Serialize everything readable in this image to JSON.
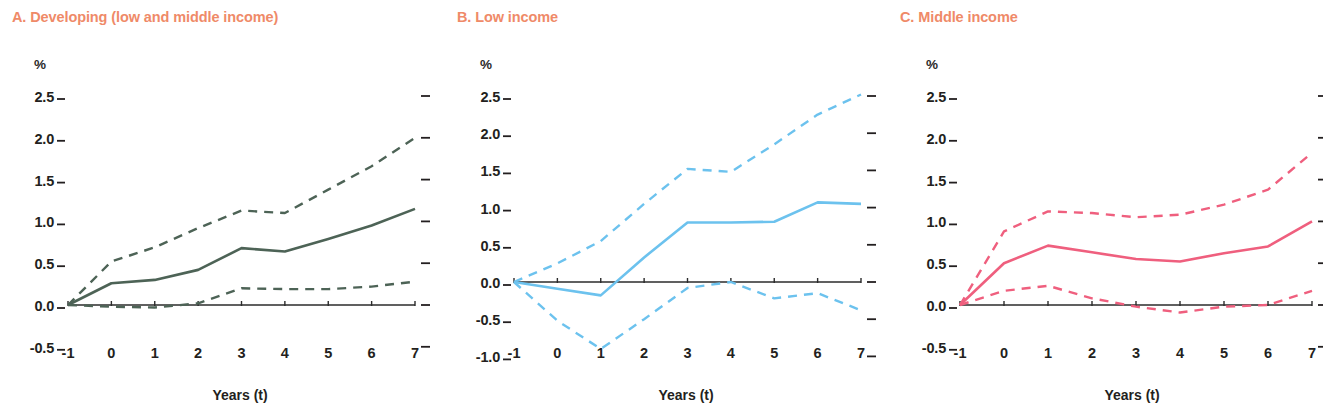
{
  "figure": {
    "title_color": "#ef8a68",
    "axis_text_color": "#231f20",
    "background": "#ffffff",
    "unit_symbol": "%",
    "x_axis_title": "Years (t)"
  },
  "panels": [
    {
      "id": "A",
      "title": "A. Developing (low and middle income)",
      "color": "#4d6356",
      "y_ticks": [
        "2.5",
        "2.0",
        "1.5",
        "1.0",
        "0.5",
        "0.0",
        "-0.5"
      ],
      "x_ticks": [
        "-1",
        "0",
        "1",
        "2",
        "3",
        "4",
        "5",
        "6",
        "7"
      ]
    },
    {
      "id": "B",
      "title": "B. Low income",
      "color": "#6cc2ee",
      "y_ticks": [
        "2.5",
        "2.0",
        "1.5",
        "1.0",
        "0.5",
        "0.0",
        "-0.5",
        "-1.0"
      ],
      "x_ticks": [
        "-1",
        "0",
        "1",
        "2",
        "3",
        "4",
        "5",
        "6",
        "7"
      ]
    },
    {
      "id": "C",
      "title": "C. Middle income",
      "color": "#ef5f7e",
      "y_ticks": [
        "2.5",
        "2.0",
        "1.5",
        "1.0",
        "0.5",
        "0.0",
        "-0.5"
      ],
      "x_ticks": [
        "-1",
        "0",
        "1",
        "2",
        "3",
        "4",
        "5",
        "6",
        "7"
      ]
    }
  ],
  "chart_data": [
    {
      "type": "line",
      "panel": "A",
      "title": "A. Developing (low and middle income)",
      "xlabel": "Years (t)",
      "ylabel": "%",
      "x": [
        -1,
        0,
        1,
        2,
        3,
        4,
        5,
        6,
        7
      ],
      "xlim": [
        -1,
        7
      ],
      "ylim": [
        -0.5,
        2.5
      ],
      "yticks": [
        -0.5,
        0.0,
        0.5,
        1.0,
        1.5,
        2.0,
        2.5
      ],
      "grid": false,
      "legend": "none",
      "color": "#4d6356",
      "series": [
        {
          "name": "Point estimate",
          "style": "solid",
          "values": [
            0.0,
            0.26,
            0.3,
            0.42,
            0.68,
            0.64,
            0.79,
            0.95,
            1.15
          ]
        },
        {
          "name": "Upper confidence band",
          "style": "dashed",
          "values": [
            0.0,
            0.52,
            0.69,
            0.92,
            1.13,
            1.1,
            1.38,
            1.66,
            2.0
          ]
        },
        {
          "name": "Lower confidence band",
          "style": "dashed",
          "values": [
            0.0,
            -0.02,
            -0.03,
            0.02,
            0.2,
            0.19,
            0.19,
            0.22,
            0.28
          ]
        }
      ]
    },
    {
      "type": "line",
      "panel": "B",
      "title": "B. Low income",
      "xlabel": "Years (t)",
      "ylabel": "%",
      "x": [
        -1,
        0,
        1,
        2,
        3,
        4,
        5,
        6,
        7
      ],
      "xlim": [
        -1,
        7
      ],
      "ylim": [
        -1.0,
        2.5
      ],
      "yticks": [
        -1.0,
        -0.5,
        0.0,
        0.5,
        1.0,
        1.5,
        2.0,
        2.5
      ],
      "grid": false,
      "legend": "none",
      "color": "#6cc2ee",
      "series": [
        {
          "name": "Point estimate",
          "style": "solid",
          "values": [
            0.0,
            -0.09,
            -0.18,
            0.33,
            0.8,
            0.8,
            0.81,
            1.07,
            1.05
          ]
        },
        {
          "name": "Upper confidence band",
          "style": "dashed",
          "values": [
            0.0,
            0.25,
            0.55,
            1.05,
            1.52,
            1.48,
            1.85,
            2.25,
            2.52
          ]
        },
        {
          "name": "Lower confidence band",
          "style": "dashed",
          "values": [
            0.0,
            -0.52,
            -0.9,
            -0.5,
            -0.08,
            0.0,
            -0.22,
            -0.15,
            -0.38
          ]
        }
      ]
    },
    {
      "type": "line",
      "panel": "C",
      "title": "C. Middle income",
      "xlabel": "Years (t)",
      "ylabel": "%",
      "x": [
        -1,
        0,
        1,
        2,
        3,
        4,
        5,
        6,
        7
      ],
      "xlim": [
        -1,
        7
      ],
      "ylim": [
        -0.5,
        2.5
      ],
      "yticks": [
        -0.5,
        0.0,
        0.5,
        1.0,
        1.5,
        2.0,
        2.5
      ],
      "grid": false,
      "legend": "none",
      "color": "#ef5f7e",
      "series": [
        {
          "name": "Point estimate",
          "style": "solid",
          "values": [
            0.0,
            0.5,
            0.71,
            0.63,
            0.55,
            0.52,
            0.62,
            0.7,
            1.0
          ]
        },
        {
          "name": "Upper confidence band",
          "style": "dashed",
          "values": [
            0.0,
            0.88,
            1.12,
            1.1,
            1.05,
            1.08,
            1.2,
            1.38,
            1.82
          ]
        },
        {
          "name": "Lower confidence band",
          "style": "dashed",
          "values": [
            0.0,
            0.17,
            0.23,
            0.08,
            -0.02,
            -0.09,
            -0.02,
            0.0,
            0.17
          ]
        }
      ]
    }
  ]
}
